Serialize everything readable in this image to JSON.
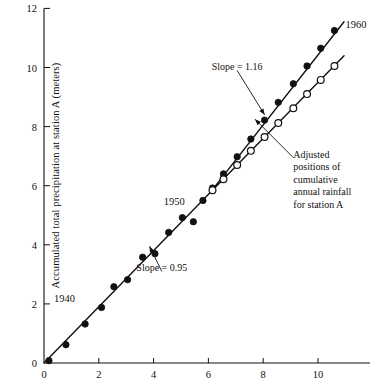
{
  "chart_data": {
    "type": "scatter",
    "title": "",
    "xlabel": "",
    "ylabel": "Accumulated total precipitation at station A (meters)",
    "xlim": [
      0,
      11.9
    ],
    "ylim": [
      0,
      12
    ],
    "xticks": [
      0,
      2,
      4,
      6,
      8,
      10
    ],
    "yticks": [
      0,
      2,
      4,
      6,
      8,
      10,
      12
    ],
    "xtick_labels": [
      "0",
      "2",
      "4",
      "6",
      "8",
      "10"
    ],
    "ytick_labels": [
      "0",
      "2",
      "4",
      "6",
      "8",
      "10",
      "12"
    ],
    "grid": false,
    "legend": "none",
    "break_point": [
      6.0,
      5.7
    ],
    "series": [
      {
        "name": "Observed cumulative annual rainfall for station A",
        "marker": "filled-circle",
        "color": "#111111",
        "points": [
          [
            0.18,
            0.08
          ],
          [
            0.8,
            0.62
          ],
          [
            1.5,
            1.32
          ],
          [
            2.1,
            1.88
          ],
          [
            2.55,
            2.58
          ],
          [
            3.05,
            2.82
          ],
          [
            3.6,
            3.58
          ],
          [
            4.05,
            3.7
          ],
          [
            4.55,
            4.42
          ],
          [
            5.05,
            4.92
          ],
          [
            5.45,
            4.78
          ],
          [
            5.8,
            5.5
          ],
          [
            6.15,
            5.92
          ],
          [
            6.55,
            6.4
          ],
          [
            7.05,
            6.98
          ],
          [
            7.55,
            7.58
          ],
          [
            8.05,
            8.22
          ],
          [
            8.55,
            8.82
          ],
          [
            9.1,
            9.45
          ],
          [
            9.6,
            10.05
          ],
          [
            10.1,
            10.65
          ],
          [
            10.6,
            11.25
          ]
        ]
      },
      {
        "name": "Adjusted positions of cumulative annual rainfall for station A",
        "marker": "open-circle",
        "color": "#111111",
        "points": [
          [
            6.15,
            5.85
          ],
          [
            6.55,
            6.22
          ],
          [
            7.05,
            6.7
          ],
          [
            7.55,
            7.18
          ],
          [
            8.05,
            7.65
          ],
          [
            8.55,
            8.12
          ],
          [
            9.1,
            8.62
          ],
          [
            9.6,
            9.1
          ],
          [
            10.1,
            9.58
          ],
          [
            10.6,
            10.05
          ]
        ]
      }
    ],
    "fit_lines": [
      {
        "name": "lower-segment",
        "slope": 0.95,
        "from": [
          0.0,
          0.0
        ],
        "to": [
          6.05,
          5.75
        ]
      },
      {
        "name": "upper-steep-segment",
        "slope": 1.16,
        "from": [
          6.05,
          5.75
        ],
        "to": [
          10.95,
          11.55
        ]
      },
      {
        "name": "upper-adjusted-segment",
        "slope": 0.95,
        "from": [
          6.05,
          5.75
        ],
        "to": [
          10.95,
          10.4
        ]
      }
    ],
    "annotations": [
      {
        "name": "slope-upper-label",
        "text": "Slope = 1.16",
        "at": [
          7.05,
          9.9
        ],
        "arrow_to": [
          8.05,
          8.4
        ]
      },
      {
        "name": "slope-lower-label",
        "text": "Slope = 0.95",
        "at": [
          4.3,
          3.1
        ],
        "arrow_to": [
          3.85,
          3.95
        ]
      },
      {
        "name": "adjusted-series-label",
        "lines": [
          "Adjusted",
          "positions of",
          "cumulative",
          "annual rainfall",
          "for station A"
        ],
        "at": [
          9.1,
          6.95
        ],
        "arrow_to": [
          7.7,
          8.25
        ]
      },
      {
        "name": "year-start-label",
        "text": "1940",
        "at": [
          0.75,
          2.05
        ]
      },
      {
        "name": "year-mid-label",
        "text": "1950",
        "at": [
          4.75,
          5.35
        ]
      },
      {
        "name": "year-end-label",
        "text": "1960",
        "at": [
          11.0,
          11.35
        ]
      }
    ]
  }
}
